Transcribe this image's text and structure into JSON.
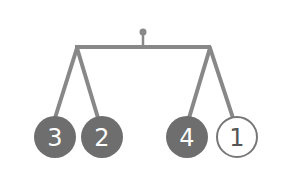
{
  "diagram": {
    "type": "mobile-balance",
    "colors": {
      "line": "#888888",
      "filled": "#6e6e6e",
      "filled_text": "#ffffff",
      "empty_fill": "#ffffff",
      "empty_stroke": "#777777",
      "empty_text": "#555555"
    },
    "weights": [
      {
        "label": "3",
        "filled": true
      },
      {
        "label": "2",
        "filled": true
      },
      {
        "label": "4",
        "filled": true
      },
      {
        "label": "1",
        "filled": false
      }
    ]
  }
}
